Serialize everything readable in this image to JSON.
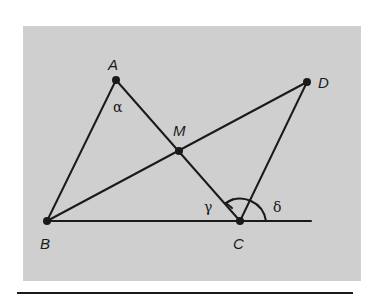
{
  "colors": {
    "panel": "#cfcfcf",
    "ink": "#1a1a1a",
    "background": "#ffffff"
  },
  "points": {
    "A": {
      "label": "A",
      "x": 116,
      "y": 80
    },
    "B": {
      "label": "B",
      "x": 47,
      "y": 221
    },
    "C": {
      "label": "C",
      "x": 240,
      "y": 221
    },
    "D": {
      "label": "D",
      "x": 307,
      "y": 82
    },
    "M": {
      "label": "M",
      "x": 179,
      "y": 151
    }
  },
  "angles": {
    "alpha": {
      "label": "α",
      "x": 113,
      "y": 112
    },
    "gamma": {
      "label": "γ",
      "x": 204,
      "y": 212
    },
    "delta": {
      "label": "δ",
      "x": 273,
      "y": 212
    }
  },
  "label_positions": {
    "A": {
      "x": 108,
      "y": 70
    },
    "B": {
      "x": 40,
      "y": 249
    },
    "C": {
      "x": 233,
      "y": 249
    },
    "D": {
      "x": 318,
      "y": 88
    },
    "M": {
      "x": 173,
      "y": 136
    }
  }
}
